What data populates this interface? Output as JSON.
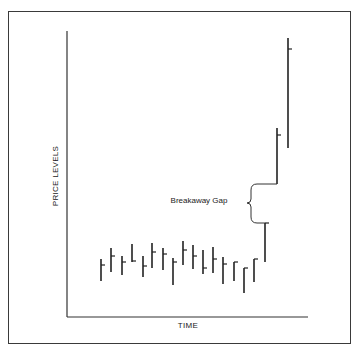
{
  "diagram": {
    "y_axis_label": "PRICE LEVELS",
    "x_axis_label": "TIME",
    "annotation": "Breakaway Gap",
    "colors": {
      "ink": "#222222",
      "frame": "#3a3a3a",
      "background": "#ffffff"
    }
  },
  "chart_data": {
    "type": "bar",
    "title": "",
    "xlabel": "TIME",
    "ylabel": "PRICE LEVELS",
    "bars": [
      {
        "x": 101,
        "high": 259,
        "low": 281,
        "close": 265
      },
      {
        "x": 111,
        "high": 248,
        "low": 272,
        "close": 256
      },
      {
        "x": 122,
        "high": 256,
        "low": 275,
        "close": 262
      },
      {
        "x": 132,
        "high": 244,
        "low": 262,
        "close": 261
      },
      {
        "x": 143,
        "high": 256,
        "low": 277,
        "close": 266
      },
      {
        "x": 152,
        "high": 243,
        "low": 268,
        "close": 252
      },
      {
        "x": 163,
        "high": 248,
        "low": 270,
        "close": 254
      },
      {
        "x": 173,
        "high": 258,
        "low": 285,
        "close": 262
      },
      {
        "x": 183,
        "high": 241,
        "low": 265,
        "close": 250
      },
      {
        "x": 193,
        "high": 245,
        "low": 269,
        "close": 256
      },
      {
        "x": 203,
        "high": 250,
        "low": 274,
        "close": 268
      },
      {
        "x": 213,
        "high": 247,
        "low": 273,
        "close": 259
      },
      {
        "x": 223,
        "high": 257,
        "low": 284,
        "close": 264
      },
      {
        "x": 234,
        "high": 262,
        "low": 281,
        "close": 262
      },
      {
        "x": 244,
        "high": 268,
        "low": 293,
        "close": 268
      },
      {
        "x": 254,
        "high": 259,
        "low": 282,
        "close": 259
      },
      {
        "x": 265,
        "high": 223,
        "low": 262,
        "close": 223
      },
      {
        "x": 277,
        "high": 128,
        "low": 184,
        "close": 135
      },
      {
        "x": 288,
        "high": 38,
        "low": 148,
        "close": 49
      }
    ],
    "gap": {
      "from_y": 184,
      "to_y": 223,
      "label": "Breakaway Gap"
    }
  }
}
